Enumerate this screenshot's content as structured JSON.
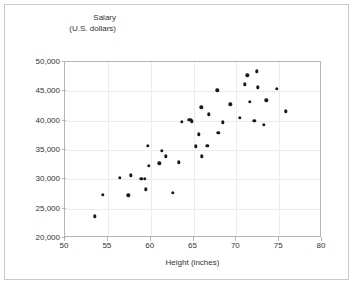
{
  "chart_data": {
    "type": "scatter",
    "title": "",
    "xlabel": "Height (inches)",
    "ylabel_line1": "Salary",
    "ylabel_line2": "(U.S. dollars)",
    "xlim": [
      50,
      80
    ],
    "ylim": [
      20000,
      50000
    ],
    "xticks": [
      50,
      55,
      60,
      65,
      70,
      75,
      80
    ],
    "xtick_labels": [
      "50",
      "55",
      "60",
      "65",
      "70",
      "75",
      "80"
    ],
    "yticks": [
      20000,
      25000,
      30000,
      35000,
      40000,
      45000,
      50000
    ],
    "ytick_labels": [
      "20,000",
      "25,000",
      "30,000",
      "35,000",
      "40,000",
      "45,000",
      "50,000"
    ],
    "grid": true,
    "legend": "none",
    "marker_color": "#1a1a1a",
    "points": [
      {
        "x": 53.5,
        "y": 23700
      },
      {
        "x": 54.4,
        "y": 27400
      },
      {
        "x": 56.4,
        "y": 30300
      },
      {
        "x": 57.4,
        "y": 27300
      },
      {
        "x": 57.7,
        "y": 30700
      },
      {
        "x": 58.9,
        "y": 30100
      },
      {
        "x": 59.3,
        "y": 30100
      },
      {
        "x": 59.4,
        "y": 28300
      },
      {
        "x": 59.7,
        "y": 35700
      },
      {
        "x": 59.8,
        "y": 32300
      },
      {
        "x": 61.0,
        "y": 32700
      },
      {
        "x": 61.3,
        "y": 34900
      },
      {
        "x": 61.8,
        "y": 33900
      },
      {
        "x": 62.6,
        "y": 27700
      },
      {
        "x": 63.3,
        "y": 32900
      },
      {
        "x": 63.6,
        "y": 39800
      },
      {
        "x": 64.5,
        "y": 40100
      },
      {
        "x": 64.7,
        "y": 40100
      },
      {
        "x": 64.8,
        "y": 39900
      },
      {
        "x": 65.3,
        "y": 35600
      },
      {
        "x": 65.6,
        "y": 37700
      },
      {
        "x": 65.9,
        "y": 42300
      },
      {
        "x": 66.0,
        "y": 33900
      },
      {
        "x": 66.6,
        "y": 35700
      },
      {
        "x": 66.8,
        "y": 41100
      },
      {
        "x": 67.8,
        "y": 45200
      },
      {
        "x": 67.9,
        "y": 37900
      },
      {
        "x": 68.4,
        "y": 39700
      },
      {
        "x": 69.3,
        "y": 42800
      },
      {
        "x": 70.4,
        "y": 40500
      },
      {
        "x": 71.0,
        "y": 46200
      },
      {
        "x": 71.3,
        "y": 47700
      },
      {
        "x": 71.6,
        "y": 43200
      },
      {
        "x": 72.1,
        "y": 40000
      },
      {
        "x": 72.4,
        "y": 48400
      },
      {
        "x": 72.5,
        "y": 45700
      },
      {
        "x": 73.2,
        "y": 39300
      },
      {
        "x": 73.5,
        "y": 43500
      },
      {
        "x": 74.7,
        "y": 45400
      },
      {
        "x": 75.8,
        "y": 41600
      }
    ]
  }
}
